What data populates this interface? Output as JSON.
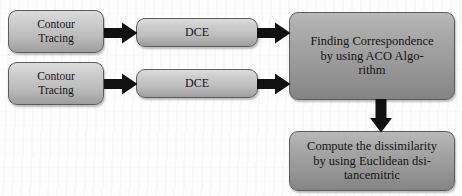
{
  "diagram": {
    "background_color": "#fdfdfd",
    "node_light_color": "#cfcfcf",
    "node_dark_color": "#9a9a9a",
    "arrow_color": "#111111",
    "nodes": [
      {
        "id": "contour-tracing-1",
        "label": "Contour\nTracing"
      },
      {
        "id": "contour-tracing-2",
        "label": "Contour\nTracing"
      },
      {
        "id": "dce-1",
        "label": "DCE"
      },
      {
        "id": "dce-2",
        "label": "DCE"
      },
      {
        "id": "aco",
        "label": "Finding Correspondence\nby using ACO Algo-\nrithm"
      },
      {
        "id": "euclidean",
        "label": "Compute the dissimilarity\nby using Euclidean dsi-\ntancemitric"
      }
    ],
    "arrows": [
      {
        "id": "arrow-contour1-dce1",
        "direction": "right"
      },
      {
        "id": "arrow-contour2-dce2",
        "direction": "right"
      },
      {
        "id": "arrow-dce1-aco",
        "direction": "right"
      },
      {
        "id": "arrow-dce2-aco",
        "direction": "right"
      },
      {
        "id": "arrow-aco-euclidean",
        "direction": "down"
      }
    ]
  }
}
